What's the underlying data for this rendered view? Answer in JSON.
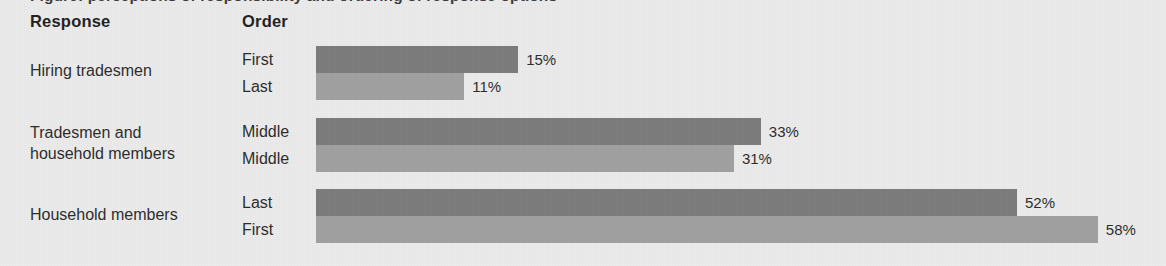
{
  "top_clipped_caption": "Figure: perceptions of responsibility and ordering of response options",
  "headers": {
    "response": "Response",
    "order": "Order"
  },
  "colors": {
    "background": "#ebebeb",
    "bar_dark": "#7b7b7b",
    "bar_light": "#a0a0a0",
    "text": "#2b2b2b"
  },
  "chart_data": {
    "type": "bar",
    "orientation": "horizontal",
    "title": "",
    "xlabel": "",
    "ylabel": "",
    "xlim": [
      0,
      58
    ],
    "grid": false,
    "legend": null,
    "value_suffix": "%",
    "categories": [
      "Hiring tradesmen",
      "Tradesmen and household members",
      "Household members"
    ],
    "series": [
      {
        "name": "First listed variant",
        "values": [
          15,
          33,
          52
        ]
      },
      {
        "name": "Second listed variant",
        "values": [
          11,
          31,
          58
        ]
      }
    ],
    "groups": [
      {
        "response": "Hiring tradesmen",
        "bars": [
          {
            "order": "First",
            "value": 15,
            "value_label": "15%",
            "shade": "dark"
          },
          {
            "order": "Last",
            "value": 11,
            "value_label": "11%",
            "shade": "light"
          }
        ]
      },
      {
        "response": "Tradesmen and\nhousehold members",
        "bars": [
          {
            "order": "Middle",
            "value": 33,
            "value_label": "33%",
            "shade": "dark"
          },
          {
            "order": "Middle",
            "value": 31,
            "value_label": "31%",
            "shade": "light"
          }
        ]
      },
      {
        "response": "Household members",
        "bars": [
          {
            "order": "Last",
            "value": 52,
            "value_label": "52%",
            "shade": "dark"
          },
          {
            "order": "First",
            "value": 58,
            "value_label": "58%",
            "shade": "light"
          }
        ]
      }
    ]
  },
  "scale": {
    "bar_origin_px": 316,
    "px_per_percent": 13.48
  }
}
